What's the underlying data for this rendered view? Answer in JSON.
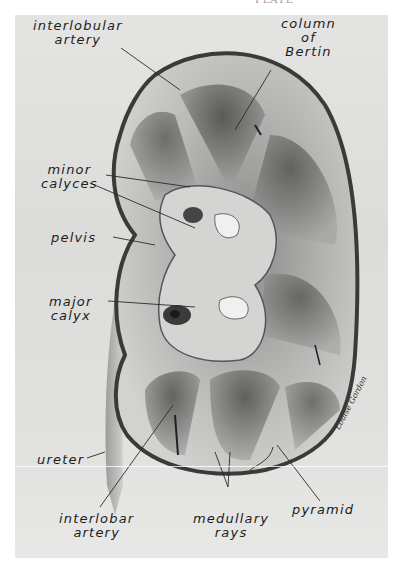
{
  "page": {
    "running_head": "PLATE"
  },
  "figure": {
    "signature": "Louise Gordon",
    "labels": {
      "interlobular_artery": [
        "interlobular",
        "artery"
      ],
      "column_of_bertin": [
        "column",
        "of",
        "Bertin"
      ],
      "minor_calyces": [
        "minor",
        "calyces"
      ],
      "pelvis": [
        "pelvis"
      ],
      "major_calyx": [
        "major",
        "calyx"
      ],
      "ureter": [
        "ureter"
      ],
      "interlobar_artery": [
        "interlobar",
        "artery"
      ],
      "medullary_rays": [
        "medullary",
        "rays"
      ],
      "pyramid": [
        "pyramid"
      ]
    }
  }
}
